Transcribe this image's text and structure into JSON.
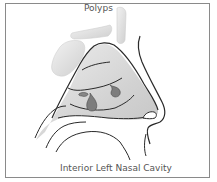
{
  "diagram": {
    "top_label": "Polyps",
    "caption": "Interior Left Nasal Cavity",
    "colors": {
      "outline": "#2a2a2a",
      "tissue_fill": "#d4d4d4",
      "bone_fill": "#e2e2e2",
      "polyp_fill": "#7d7d7d",
      "frame": "#8a8a8a",
      "label_text": "#555555"
    }
  }
}
